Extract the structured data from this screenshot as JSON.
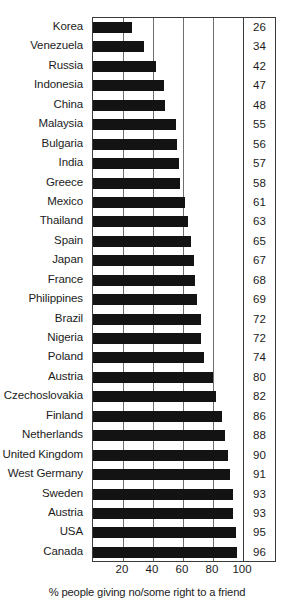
{
  "chart_data": {
    "type": "bar",
    "orientation": "horizontal",
    "title": "",
    "subtitle": "",
    "xlabel": "% people giving no/some right to a friend",
    "ylabel": "",
    "xlim": [
      0,
      100
    ],
    "xticks": [
      20,
      40,
      60,
      80,
      100
    ],
    "grid": true,
    "legend": null,
    "value_labels_shown": true,
    "categories": [
      "Korea",
      "Venezuela",
      "Russia",
      "Indonesia",
      "China",
      "Malaysia",
      "Bulgaria",
      "India",
      "Greece",
      "Mexico",
      "Thailand",
      "Spain",
      "Japan",
      "France",
      "Philippines",
      "Brazil",
      "Nigeria",
      "Poland",
      "Austria",
      "Czechoslovakia",
      "Finland",
      "Netherlands",
      "United Kingdom",
      "West Germany",
      "Sweden",
      "Austria",
      "USA",
      "Canada"
    ],
    "values": [
      26,
      34,
      42,
      47,
      48,
      55,
      56,
      57,
      58,
      61,
      63,
      65,
      67,
      68,
      69,
      72,
      72,
      74,
      80,
      82,
      86,
      88,
      90,
      91,
      93,
      93,
      95,
      96
    ],
    "bar_color": "#131313",
    "axis_color": "#3b3b3b",
    "gridline_color": "#6e6e6e"
  }
}
